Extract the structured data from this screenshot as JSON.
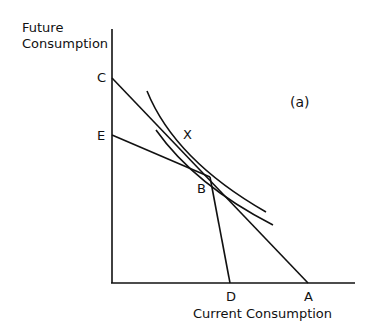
{
  "diagram": {
    "panel_label": "(a)",
    "y_axis_label_line1": "Future",
    "y_axis_label_line2": "Consumption",
    "x_axis_label": "Current Consumption",
    "points": {
      "C": "C",
      "E": "E",
      "B": "B",
      "D": "D",
      "A": "A",
      "X": "X"
    },
    "lines": [
      {
        "name": "budget-line-CA",
        "from": "C",
        "to": "A"
      },
      {
        "name": "budget-line-EB",
        "from": "E",
        "to": "B"
      },
      {
        "name": "budget-line-BD",
        "from": "B",
        "to": "D"
      }
    ],
    "curves": [
      {
        "name": "indifference-curve-upper",
        "label": "X"
      },
      {
        "name": "indifference-curve-lower",
        "tangent_at": "B"
      }
    ]
  }
}
